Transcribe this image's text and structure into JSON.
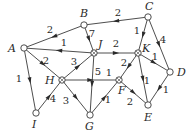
{
  "diagram": {
    "type": "weighted-directed-graph",
    "nodes": [
      {
        "id": "A",
        "label": "A",
        "x": 24,
        "y": 48,
        "lx": 8,
        "ly": 52
      },
      {
        "id": "B",
        "label": "B",
        "x": 84,
        "y": 25,
        "lx": 80,
        "ly": 17
      },
      {
        "id": "C",
        "label": "C",
        "x": 148,
        "y": 17,
        "lx": 145,
        "ly": 10
      },
      {
        "id": "J",
        "label": "J",
        "x": 94,
        "y": 53,
        "lx": 98,
        "ly": 48
      },
      {
        "id": "K",
        "label": "K",
        "x": 138,
        "y": 53,
        "lx": 142,
        "ly": 52
      },
      {
        "id": "D",
        "label": "D",
        "x": 170,
        "y": 72,
        "lx": 177,
        "ly": 76
      },
      {
        "id": "H",
        "label": "H",
        "x": 62,
        "y": 80,
        "lx": 45,
        "ly": 84
      },
      {
        "id": "F",
        "label": "F",
        "x": 119,
        "y": 80,
        "lx": 118,
        "ly": 94
      },
      {
        "id": "I",
        "label": "I",
        "x": 36,
        "y": 113,
        "lx": 32,
        "ly": 128
      },
      {
        "id": "G",
        "label": "G",
        "x": 90,
        "y": 115,
        "lx": 85,
        "ly": 130
      },
      {
        "id": "E",
        "label": "E",
        "x": 148,
        "y": 105,
        "lx": 144,
        "ly": 121
      }
    ],
    "edges": [
      {
        "from": "B",
        "to": "A",
        "weight": "2",
        "wx": 50,
        "wy": 33
      },
      {
        "from": "C",
        "to": "B",
        "weight": "2",
        "wx": 118,
        "wy": 16
      },
      {
        "from": "B",
        "to": "J",
        "weight": "7",
        "wx": 92,
        "wy": 37
      },
      {
        "from": "J",
        "to": "A",
        "weight": "1",
        "wx": 64,
        "wy": 46
      },
      {
        "from": "A",
        "to": "H",
        "weight": "2",
        "wx": 46,
        "wy": 64
      },
      {
        "from": "A",
        "to": "I",
        "weight": "1",
        "wx": 19,
        "wy": 82
      },
      {
        "from": "H",
        "to": "J",
        "weight": "3",
        "wx": 74,
        "wy": 65
      },
      {
        "from": "J",
        "to": "K",
        "weight": "2",
        "wx": 116,
        "wy": 47
      },
      {
        "from": "J",
        "to": "G",
        "weight": "5",
        "wx": 98,
        "wy": 75
      },
      {
        "from": "C",
        "to": "K",
        "weight": "1",
        "wx": 137,
        "wy": 34
      },
      {
        "from": "C",
        "to": "D",
        "weight": "4",
        "wx": 163,
        "wy": 43
      },
      {
        "from": "K",
        "to": "D",
        "weight": "1",
        "wx": 155,
        "wy": 60
      },
      {
        "from": "K",
        "to": "F",
        "weight": "2",
        "wx": 124,
        "wy": 66
      },
      {
        "from": "K",
        "to": "E",
        "weight": "1",
        "wx": 147,
        "wy": 84
      },
      {
        "from": "H",
        "to": "F",
        "weight": "1",
        "wx": 109,
        "wy": 76
      },
      {
        "from": "I",
        "to": "H",
        "weight": "4",
        "wx": 53,
        "wy": 102
      },
      {
        "from": "H",
        "to": "G",
        "weight": "3",
        "wx": 66,
        "wy": 104
      },
      {
        "from": "G",
        "to": "F",
        "weight": "1",
        "wx": 108,
        "wy": 103
      },
      {
        "from": "F",
        "to": "E",
        "weight": "2",
        "wx": 130,
        "wy": 105
      },
      {
        "from": "D",
        "to": "E",
        "weight": "1",
        "wx": 166,
        "wy": 93
      }
    ],
    "crossed_nodes": [
      "H",
      "J",
      "K",
      "F"
    ]
  }
}
